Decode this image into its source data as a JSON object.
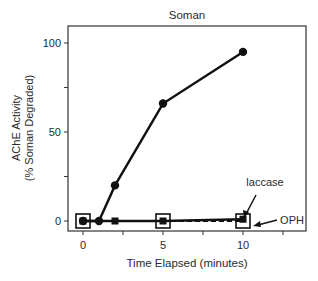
{
  "chart_data": {
    "type": "line",
    "title": "Soman",
    "xlabel": "Time Elapsed (minutes)",
    "ylabel_line1": "AChE Activity",
    "ylabel_line2": "(% Soman Degraded)",
    "xlim": [
      -1,
      14
    ],
    "ylim": [
      -5,
      112
    ],
    "x_ticks": [
      0,
      2.5,
      5,
      7.5,
      10,
      12.5
    ],
    "x_tick_labels": [
      "0",
      "5",
      "10"
    ],
    "x_labeled_ticks": [
      0,
      5,
      10
    ],
    "y_ticks": [
      0,
      25,
      50,
      75,
      100
    ],
    "y_tick_labels": [
      "0",
      "50",
      "100"
    ],
    "y_labeled_ticks": [
      0,
      50,
      100
    ],
    "grid": false,
    "legend": "inline annotations",
    "series": [
      {
        "name": "control (AChE)",
        "marker": "filled-circle",
        "line": "solid",
        "x": [
          0,
          1,
          2,
          5,
          10
        ],
        "y": [
          0,
          0,
          20,
          66,
          95
        ]
      },
      {
        "name": "laccase",
        "marker": "filled-square",
        "line": "solid",
        "x": [
          0,
          2,
          5,
          10
        ],
        "y": [
          0,
          0,
          0,
          1
        ]
      },
      {
        "name": "OPH",
        "marker": "open-square",
        "line": "dashed",
        "x": [
          0,
          5,
          10
        ],
        "y": [
          0,
          0,
          0
        ]
      }
    ],
    "annotations": [
      {
        "text": "laccase",
        "points_to": {
          "x": 10,
          "y": 1
        }
      },
      {
        "text": "OPH",
        "points_to": {
          "x": 10,
          "y": 0
        }
      }
    ]
  }
}
